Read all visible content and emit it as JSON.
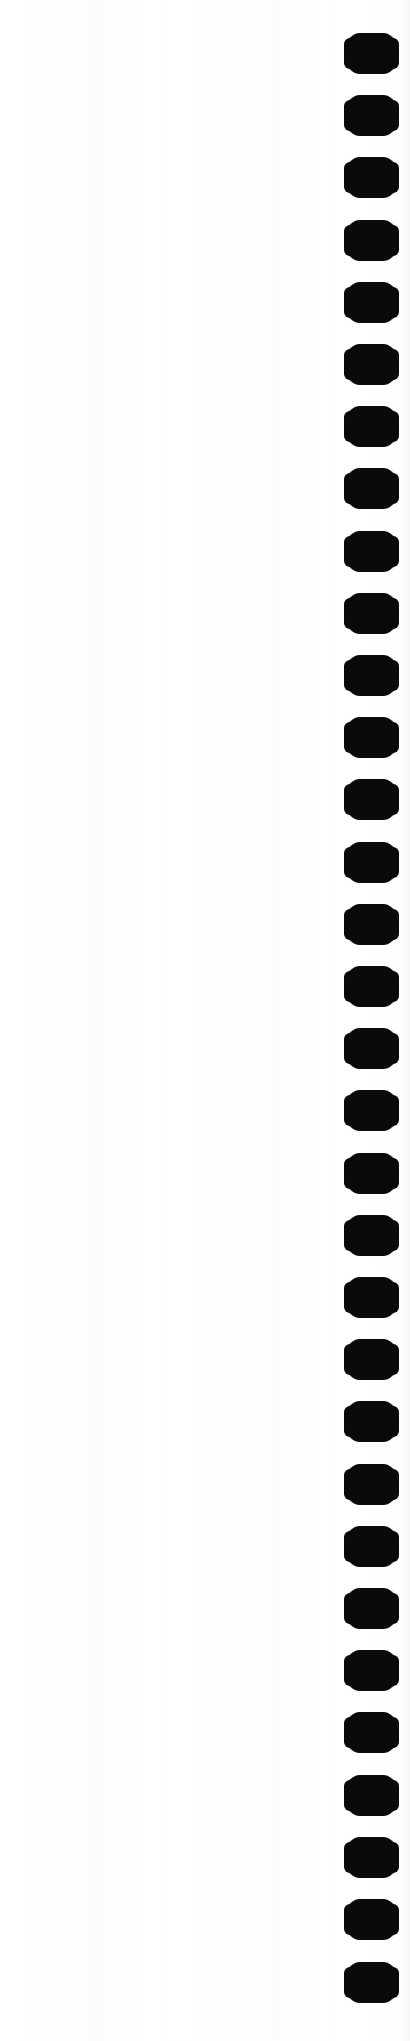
{
  "page": {
    "kind": "scanned-document-page",
    "width": 410,
    "height": 2041,
    "background_color": "#ffffff",
    "paper_tone_color": "#fefefe",
    "body_text": "",
    "visible_text": []
  },
  "binding_edge": {
    "label": "punched binding holes",
    "hole_color": "#0a0a0a",
    "hole_count": 32,
    "hole_shape": "rounded-rectangle",
    "hole_width": 53,
    "hole_height": 39,
    "column_left": 345,
    "first_center_y": 53,
    "pitch": 62.2,
    "holes": [
      {
        "index": 1,
        "center_y": 53
      },
      {
        "index": 2,
        "center_y": 115
      },
      {
        "index": 3,
        "center_y": 177
      },
      {
        "index": 4,
        "center_y": 240
      },
      {
        "index": 5,
        "center_y": 302
      },
      {
        "index": 6,
        "center_y": 364
      },
      {
        "index": 7,
        "center_y": 426
      },
      {
        "index": 8,
        "center_y": 488
      },
      {
        "index": 9,
        "center_y": 551
      },
      {
        "index": 10,
        "center_y": 613
      },
      {
        "index": 11,
        "center_y": 675
      },
      {
        "index": 12,
        "center_y": 737
      },
      {
        "index": 13,
        "center_y": 799
      },
      {
        "index": 14,
        "center_y": 862
      },
      {
        "index": 15,
        "center_y": 924
      },
      {
        "index": 16,
        "center_y": 986
      },
      {
        "index": 17,
        "center_y": 1048
      },
      {
        "index": 18,
        "center_y": 1110
      },
      {
        "index": 19,
        "center_y": 1173
      },
      {
        "index": 20,
        "center_y": 1235
      },
      {
        "index": 21,
        "center_y": 1297
      },
      {
        "index": 22,
        "center_y": 1359
      },
      {
        "index": 23,
        "center_y": 1421
      },
      {
        "index": 24,
        "center_y": 1484
      },
      {
        "index": 25,
        "center_y": 1546
      },
      {
        "index": 26,
        "center_y": 1608
      },
      {
        "index": 27,
        "center_y": 1670
      },
      {
        "index": 28,
        "center_y": 1732
      },
      {
        "index": 29,
        "center_y": 1795
      },
      {
        "index": 30,
        "center_y": 1857
      },
      {
        "index": 31,
        "center_y": 1919
      },
      {
        "index": 32,
        "center_y": 1982
      }
    ]
  },
  "scan_artifacts": {
    "streak_color": "#fbfbfb",
    "streaks": [
      93,
      99,
      165,
      277,
      332
    ]
  }
}
